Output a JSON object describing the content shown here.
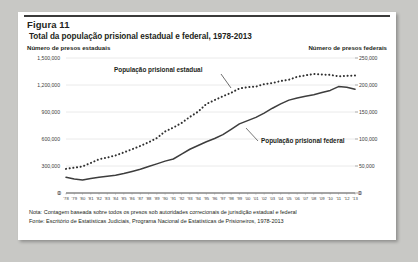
{
  "figure": {
    "number_label": "Figura 11",
    "title": "Total da população prisional estadual e federal, 1978-2013",
    "left_axis_title": "Número de presos estaduais",
    "right_axis_title": "Número de presos federais",
    "note": "Nota: Contagem baseada sobre todos os presos sob autoridades correcionais de jurisdição estadual e federal",
    "source": "Fonte: Escritório de Estatísticas Judiciais, Programa Nacional de Estatísticas de Prisioneiros, 1978-2013"
  },
  "colors": {
    "rule": "#3a3a3a",
    "text": "#231f20",
    "series_state": "#2f2f2f",
    "series_federal": "#3d3d3d",
    "grid": "#d9d9d9",
    "card": "#ffffff",
    "page": "#c8c8c5"
  },
  "chart_data": {
    "type": "line",
    "title": "Total da população prisional estadual e federal, 1978-2013",
    "xlabel": "",
    "ylabel": "Número de presos estaduais",
    "y2label": "Número de presos federais",
    "ylim": [
      0,
      1500000
    ],
    "y2lim": [
      0,
      250000
    ],
    "grid": true,
    "legend": "in-plot annotations",
    "yticks": [
      "0",
      "300,000",
      "600,000",
      "900,000",
      "1,200,000",
      "1,500,000"
    ],
    "ytick_values": [
      0,
      300000,
      600000,
      900000,
      1200000,
      1500000
    ],
    "y2ticks": [
      "0",
      "50,000",
      "100,000",
      "150,000",
      "200,000",
      "250,000"
    ],
    "y2tick_values": [
      0,
      50000,
      100000,
      150000,
      200000,
      250000
    ],
    "x": [
      1978,
      1979,
      1980,
      1981,
      1982,
      1983,
      1984,
      1985,
      1986,
      1987,
      1988,
      1989,
      1990,
      1991,
      1992,
      1993,
      1994,
      1995,
      1996,
      1997,
      1998,
      1999,
      2000,
      2001,
      2002,
      2003,
      2004,
      2005,
      2006,
      2007,
      2008,
      2009,
      2010,
      2011,
      2012,
      2013
    ],
    "xticks": [
      "'78",
      "'79",
      "'80",
      "'81",
      "'82",
      "'83",
      "'84",
      "'85",
      "'86",
      "'87",
      "'88",
      "'89",
      "'90",
      "'91",
      "'92",
      "'93",
      "'94",
      "'95",
      "'96",
      "'97",
      "'98",
      "'99",
      "'00",
      "'01",
      "'02",
      "'03",
      "'04",
      "'05",
      "'06",
      "'07",
      "'08",
      "'09",
      "'10",
      "'11",
      "'12",
      "'13"
    ],
    "series": [
      {
        "name": "População prisional estadual",
        "axis": "left",
        "style": "dotted",
        "values": [
          268000,
          281000,
          295000,
          334000,
          375000,
          394000,
          417000,
          451000,
          486000,
          522000,
          563000,
          610000,
          684000,
          727000,
          778000,
          846000,
          904000,
          989000,
          1032000,
          1075000,
          1113000,
          1161000,
          1176000,
          1182000,
          1210000,
          1222000,
          1244000,
          1259000,
          1291000,
          1307000,
          1322000,
          1317000,
          1312000,
          1297000,
          1301000,
          1306000
        ]
      },
      {
        "name": "População prisional federal",
        "axis": "right",
        "style": "solid",
        "values": [
          29000,
          26000,
          24000,
          27000,
          29000,
          31000,
          33000,
          36000,
          40000,
          44000,
          49000,
          54000,
          59000,
          63000,
          72000,
          81000,
          88000,
          95000,
          101000,
          108000,
          118000,
          128000,
          134000,
          140000,
          148000,
          157000,
          165000,
          172000,
          176000,
          179000,
          182000,
          186000,
          190000,
          197000,
          196000,
          192000
        ]
      }
    ],
    "annotations": [
      {
        "text": "População prisional estadual",
        "series": "state"
      },
      {
        "text": "População prisional federal",
        "series": "federal"
      }
    ]
  }
}
